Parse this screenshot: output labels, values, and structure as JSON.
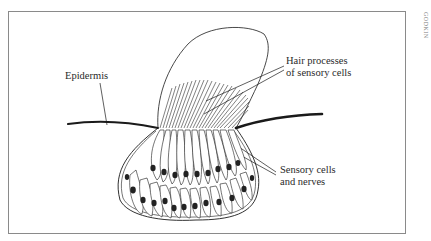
{
  "figure": {
    "credit": "GODKIN",
    "labels": {
      "epidermis": "Epidermis",
      "hair_processes_line1": "Hair processes",
      "hair_processes_line2": "of sensory cells",
      "sensory_cells_line1": "Sensory cells",
      "sensory_cells_line2": "and nerves"
    },
    "colors": {
      "stroke": "#1a1a1a",
      "frame": "#8a8a8a",
      "nucleus": "#222222",
      "background": "#ffffff"
    }
  }
}
